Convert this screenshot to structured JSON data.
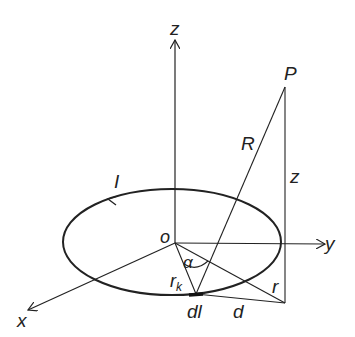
{
  "diagram": {
    "labels": {
      "z_axis": "z",
      "y_axis": "y",
      "x_axis": "x",
      "origin": "o",
      "point": "P",
      "current": "I",
      "distance_R": "R",
      "height_z": "z",
      "radius_r": "r",
      "loop_radius": "r",
      "loop_radius_sub": "k",
      "angle": "α",
      "element": "dl",
      "distance_d": "d"
    },
    "colors": {
      "stroke": "#222222",
      "background": "#ffffff"
    }
  }
}
